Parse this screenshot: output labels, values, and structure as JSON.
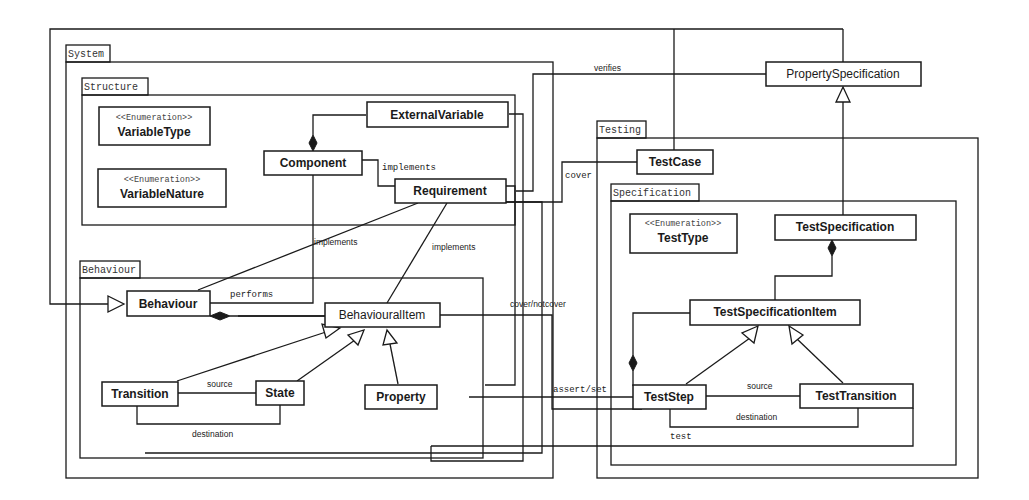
{
  "diagram": {
    "type": "uml-class-diagram",
    "packages": [
      {
        "id": "system",
        "label": "System"
      },
      {
        "id": "structure",
        "label": "Structure"
      },
      {
        "id": "behaviour",
        "label": "Behaviour"
      },
      {
        "id": "testing",
        "label": "Testing"
      },
      {
        "id": "specification",
        "label": "Specification"
      }
    ],
    "classes": {
      "variable_type": {
        "stereotype": "<<Enumeration>>",
        "name": "VariableType"
      },
      "variable_nature": {
        "stereotype": "<<Enumeration>>",
        "name": "VariableNature"
      },
      "external_variable": {
        "name": "ExternalVariable"
      },
      "component": {
        "name": "Component"
      },
      "requirement": {
        "name": "Requirement"
      },
      "behaviour": {
        "name": "Behaviour"
      },
      "behavioural_item": {
        "name": "BehaviouralItem"
      },
      "transition": {
        "name": "Transition"
      },
      "state": {
        "name": "State"
      },
      "property": {
        "name": "Property"
      },
      "property_specification": {
        "name": "PropertySpecification"
      },
      "test_case": {
        "name": "TestCase"
      },
      "test_type": {
        "stereotype": "<<Enumeration>>",
        "name": "TestType"
      },
      "test_specification": {
        "name": "TestSpecification"
      },
      "test_specification_item": {
        "name": "TestSpecificationItem"
      },
      "test_step": {
        "name": "TestStep"
      },
      "test_transition": {
        "name": "TestTransition"
      }
    },
    "edge_labels": {
      "verifies": "verifies",
      "cover": "cover",
      "implements_component": "implements",
      "implements_behaviour": "implements",
      "implements_item": "implements",
      "performs": "performs",
      "cover_notcover": "cover/notcover",
      "source_behaviour": "source",
      "destination_behaviour": "destination",
      "assert_set": "assert/set",
      "source_test": "source",
      "destination_test": "destination",
      "test": "test"
    }
  }
}
